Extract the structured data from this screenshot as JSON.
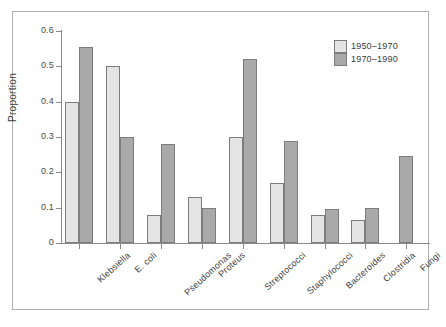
{
  "chart_data": {
    "type": "bar",
    "title": "",
    "subtitle": "",
    "xlabel": "",
    "ylabel": "Proportion",
    "ylim": [
      0,
      0.6
    ],
    "yticks": [
      "0",
      "0.1",
      "0.2",
      "0.3",
      "0.4",
      "0.5",
      "0.6"
    ],
    "ytick_values": [
      0,
      0.1,
      0.2,
      0.3,
      0.4,
      0.5,
      0.6
    ],
    "grid": false,
    "legend_position": "top-right",
    "categories": [
      "Klebsiella",
      "E. coli",
      "Pseudomonas",
      "Proteus",
      "Streptococci",
      "Staphylococci",
      "Bacteroides",
      "Clostridia",
      "Fungi"
    ],
    "series": [
      {
        "name": "1950–1970",
        "color": "#e4e4e4",
        "values": [
          0.4,
          0.5,
          0.08,
          0.13,
          0.3,
          0.17,
          0.08,
          0.065,
          null
        ]
      },
      {
        "name": "1970–1990",
        "color": "#a9a9a9",
        "values": [
          0.555,
          0.3,
          0.28,
          0.1,
          0.52,
          0.29,
          0.095,
          0.1,
          0.245
        ]
      }
    ]
  },
  "legend": {
    "entries": [
      {
        "label": "1950–1970",
        "swatch": "light"
      },
      {
        "label": "1970–1990",
        "swatch": "dark"
      }
    ]
  },
  "axis": {
    "y_title": "Proportion"
  }
}
